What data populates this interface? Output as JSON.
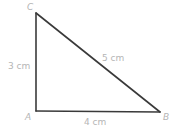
{
  "diagram": {
    "type": "right-triangle",
    "vertices": {
      "A": {
        "label": "A",
        "x": 36,
        "y": 111
      },
      "B": {
        "label": "B",
        "x": 160,
        "y": 112
      },
      "C": {
        "label": "C",
        "x": 36,
        "y": 13
      }
    },
    "sides": {
      "AC": {
        "label": "3 cm"
      },
      "CB": {
        "label": "5 cm"
      },
      "AB": {
        "label": "4 cm"
      }
    },
    "colors": {
      "line": "#3a3a3a",
      "label": "#b5b5b5",
      "background": "#ffffff"
    }
  }
}
